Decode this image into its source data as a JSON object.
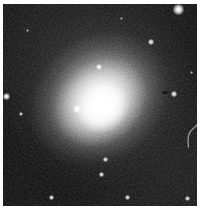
{
  "image": {
    "title": "Elliptical galaxy field",
    "object_type": "elliptical-galaxy",
    "alt_text": "Greyscale astronomical image of a bright diffuse elliptical galaxy centred in a dark noisy sky field, surrounded by several point-like stars",
    "width_px": 200,
    "height_px": 210,
    "colors": {
      "paper": "#ffffff",
      "sky_background": "#0d0d0d",
      "galaxy_core": "#ffffff",
      "galaxy_halo": "#9a9a9a",
      "defect": "#070707"
    },
    "frame": {
      "left_px": 3,
      "top_px": 4,
      "width_px": 194,
      "height_px": 202
    }
  },
  "galaxy": {
    "label": "central elliptical galaxy",
    "center_x_px": 100,
    "center_y_px": 109,
    "position_angle_deg": -38,
    "halo_semimajor_px": 108,
    "halo_semiminor_px": 93,
    "core_semimajor_px": 28,
    "core_semiminor_px": 24,
    "peak_brightness": 255
  },
  "artifacts": {
    "dark_defect": {
      "label": "dark CCD defect",
      "x_px": 159,
      "y_px": 87,
      "w_px": 7,
      "h_px": 3
    },
    "edge_streak": {
      "label": "faint curved edge artifact",
      "x_px": 182,
      "y_px": 116,
      "w_px": 14,
      "h_px": 26
    }
  },
  "stars": [
    {
      "name": "star-top-right-bright",
      "x_px": 175,
      "y_px": 5,
      "size_px": 11,
      "brightness": 250
    },
    {
      "name": "star-upper-right",
      "x_px": 148,
      "y_px": 38,
      "size_px": 6,
      "brightness": 225
    },
    {
      "name": "star-upper-mid",
      "x_px": 96,
      "y_px": 63,
      "size_px": 6,
      "brightness": 235
    },
    {
      "name": "star-left-edge",
      "x_px": 3,
      "y_px": 92,
      "size_px": 7,
      "brightness": 240
    },
    {
      "name": "star-right-of-defect",
      "x_px": 171,
      "y_px": 90,
      "size_px": 6,
      "brightness": 230
    },
    {
      "name": "globular-cluster-core",
      "x_px": 74,
      "y_px": 105,
      "size_px": 8,
      "brightness": 252
    },
    {
      "name": "star-left-mid",
      "x_px": 18,
      "y_px": 110,
      "size_px": 4,
      "brightness": 190
    },
    {
      "name": "star-lower-mid",
      "x_px": 102,
      "y_px": 155,
      "size_px": 5,
      "brightness": 215
    },
    {
      "name": "star-lower-centre",
      "x_px": 98,
      "y_px": 170,
      "size_px": 5,
      "brightness": 220
    },
    {
      "name": "star-bottom-left",
      "x_px": 48,
      "y_px": 193,
      "size_px": 5,
      "brightness": 215
    },
    {
      "name": "star-bottom-mid",
      "x_px": 124,
      "y_px": 193,
      "size_px": 5,
      "brightness": 218
    },
    {
      "name": "star-bottom-right",
      "x_px": 184,
      "y_px": 194,
      "size_px": 5,
      "brightness": 212
    },
    {
      "name": "star-faint-upper-left",
      "x_px": 24,
      "y_px": 26,
      "size_px": 3,
      "brightness": 150
    },
    {
      "name": "star-faint-top-mid",
      "x_px": 118,
      "y_px": 14,
      "size_px": 3,
      "brightness": 145
    },
    {
      "name": "star-faint-right",
      "x_px": 188,
      "y_px": 68,
      "size_px": 3,
      "brightness": 150
    }
  ]
}
